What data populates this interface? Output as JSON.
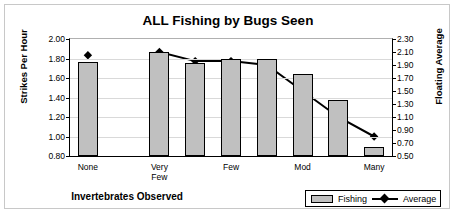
{
  "chart_data": {
    "type": "bar",
    "title": "ALL Fishing by Bugs Seen",
    "xlabel": "Invertebrates Observed",
    "ylabel": "Strikes Per Hour",
    "ylabel_secondary": "Floating Average",
    "grid": true,
    "legend_position": "bottom-right",
    "categories": [
      "None",
      "",
      "Very Few",
      "",
      "Few",
      "",
      "Mod",
      "",
      "Many"
    ],
    "category_tick_labels": [
      "None",
      "Very Few",
      "Few",
      "Mod",
      "Many"
    ],
    "ylim": [
      0.8,
      2.0
    ],
    "yticks": [
      "2.00",
      "1.80",
      "1.60",
      "1.40",
      "1.20",
      "1.00",
      "0.80"
    ],
    "ylim_secondary": [
      0.5,
      2.3
    ],
    "yticks_secondary": [
      "2.30",
      "2.10",
      "1.90",
      "1.70",
      "1.50",
      "1.30",
      "1.10",
      "0.90",
      "0.70",
      "0.50"
    ],
    "series": [
      {
        "name": "Fishing",
        "type": "bar",
        "axis": "left",
        "color": "#c0c0c0",
        "edge_color": "#000000",
        "points": [
          {
            "slot": 0,
            "value": 1.76
          },
          {
            "slot": 2,
            "value": 1.87
          },
          {
            "slot": 3,
            "value": 1.75
          },
          {
            "slot": 4,
            "value": 1.8
          },
          {
            "slot": 5,
            "value": 1.8
          },
          {
            "slot": 6,
            "value": 1.64
          },
          {
            "slot": 7,
            "value": 1.37
          },
          {
            "slot": 8,
            "value": 0.89
          }
        ]
      },
      {
        "name": "Average",
        "type": "line",
        "axis": "right",
        "color": "#000000",
        "marker": "diamond",
        "points": [
          {
            "slot": 0,
            "value": 2.05,
            "connected": false
          },
          {
            "slot": 2,
            "value": 2.1,
            "connected": true
          },
          {
            "slot": 3,
            "value": 1.96,
            "connected": true
          },
          {
            "slot": 4,
            "value": 1.96,
            "connected": true
          },
          {
            "slot": 5,
            "value": 1.9,
            "connected": true
          },
          {
            "slot": 6,
            "value": 1.5,
            "connected": true
          },
          {
            "slot": 7,
            "value": 1.1,
            "connected": true
          },
          {
            "slot": 8,
            "value": 0.8,
            "connected": true
          }
        ]
      }
    ],
    "legend": [
      {
        "label": "Fishing",
        "marker": "bar-swatch"
      },
      {
        "label": "Average",
        "marker": "line-diamond"
      }
    ]
  }
}
